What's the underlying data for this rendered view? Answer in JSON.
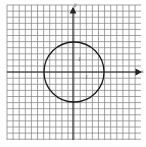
{
  "figure": {
    "type": "coordinate-plane-with-circle",
    "grid": {
      "columns": 22,
      "rows": 22,
      "spacing_px": 6.1,
      "color": "#8a8a8a"
    },
    "axes": {
      "x_label": "x",
      "y_label": "y",
      "color": "#222222"
    },
    "circle": {
      "center": [
        0,
        0
      ],
      "radius_squares": 5,
      "color": "#1a1a1a"
    },
    "tick_labels": {
      "x_unit": "1",
      "y_unit": "1"
    }
  }
}
